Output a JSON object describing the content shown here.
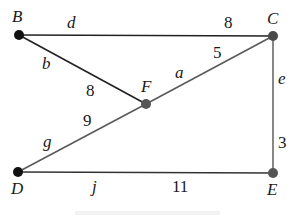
{
  "graph": {
    "nodes": [
      {
        "id": "B",
        "label": "B",
        "x": 19,
        "y": 35,
        "color": "#111111",
        "label_x": 12,
        "label_y": 22
      },
      {
        "id": "C",
        "label": "C",
        "x": 273,
        "y": 36,
        "color": "#4a4a4a",
        "label_x": 267,
        "label_y": 24
      },
      {
        "id": "F",
        "label": "F",
        "x": 146,
        "y": 104,
        "color": "#555555",
        "label_x": 141,
        "label_y": 92
      },
      {
        "id": "D",
        "label": "D",
        "x": 18,
        "y": 172,
        "color": "#111111",
        "label_x": 11,
        "label_y": 194
      },
      {
        "id": "E",
        "label": "E",
        "x": 273,
        "y": 173,
        "color": "#555555",
        "label_x": 267,
        "label_y": 195
      }
    ],
    "edges": [
      {
        "id": "d",
        "from": "B",
        "to": "C",
        "name": "d",
        "weight": "8",
        "color": "#222222",
        "name_x": 67,
        "name_y": 28,
        "weight_x": 224,
        "weight_y": 28
      },
      {
        "id": "b",
        "from": "B",
        "to": "F",
        "name": "b",
        "weight": "8",
        "color": "#222222",
        "name_x": 42,
        "name_y": 69,
        "weight_x": 86,
        "weight_y": 96
      },
      {
        "id": "a",
        "from": "F",
        "to": "C",
        "name": "a",
        "weight": "5",
        "color": "#5a5a5a",
        "name_x": 175,
        "name_y": 78,
        "weight_x": 213,
        "weight_y": 58
      },
      {
        "id": "e",
        "from": "C",
        "to": "E",
        "name": "e",
        "weight": "3",
        "color": "#6a6a6a",
        "name_x": 278,
        "name_y": 84,
        "weight_x": 278,
        "weight_y": 148
      },
      {
        "id": "g",
        "from": "D",
        "to": "F",
        "name": "g",
        "weight": "9",
        "color": "#5a5a5a",
        "name_x": 43,
        "name_y": 147,
        "weight_x": 83,
        "weight_y": 126
      },
      {
        "id": "j",
        "from": "D",
        "to": "E",
        "name": "j",
        "weight": "11",
        "color": "#333333",
        "name_x": 92,
        "name_y": 192,
        "weight_x": 172,
        "weight_y": 192
      }
    ]
  }
}
